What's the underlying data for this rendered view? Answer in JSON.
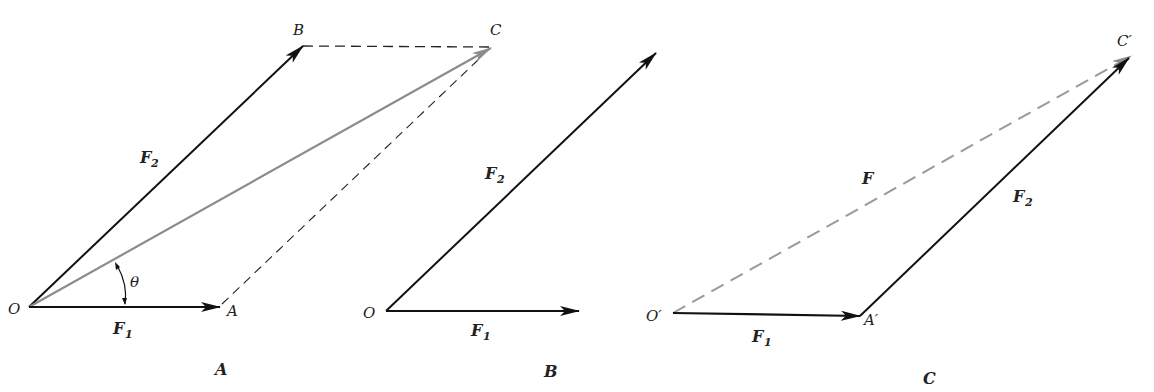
{
  "colors": {
    "vector": "#111111",
    "resultant": "#8c8c8c",
    "construction_dashed": "#222222",
    "resultant_dashed": "#9a9a9a",
    "background": "#ffffff"
  },
  "panels": [
    {
      "id": "A",
      "caption": "A",
      "method": "parallelogram",
      "points": {
        "O": "O",
        "A": "A",
        "B": "B",
        "C": "C"
      },
      "vectors": [
        {
          "name": "F1",
          "label": "F",
          "sub": "1",
          "from": "O",
          "to": "A",
          "style": "solid-black"
        },
        {
          "name": "F2",
          "label": "F",
          "sub": "2",
          "from": "O",
          "to": "B",
          "style": "solid-black"
        },
        {
          "name": "resultant",
          "from": "O",
          "to": "C",
          "style": "solid-gray"
        }
      ],
      "construction_lines": [
        {
          "from": "B",
          "to": "C",
          "style": "dashed"
        },
        {
          "from": "A",
          "to": "C",
          "style": "dashed"
        }
      ],
      "angle": {
        "label": "θ",
        "between": [
          "F1",
          "resultant"
        ]
      }
    },
    {
      "id": "B",
      "caption": "B",
      "method": "two vectors from common origin",
      "points": {
        "O": "O"
      },
      "vectors": [
        {
          "name": "F1",
          "label": "F",
          "sub": "1",
          "from": "O",
          "style": "solid-black"
        },
        {
          "name": "F2",
          "label": "F",
          "sub": "2",
          "from": "O",
          "style": "solid-black"
        }
      ]
    },
    {
      "id": "C",
      "caption": "C",
      "method": "triangle (head-to-tail)",
      "points": {
        "O": "O′",
        "A": "A′",
        "C": "C′"
      },
      "vectors": [
        {
          "name": "F1",
          "label": "F",
          "sub": "1",
          "from": "O′",
          "to": "A′",
          "style": "solid-black"
        },
        {
          "name": "F2",
          "label": "F",
          "sub": "2",
          "from": "A′",
          "to": "C′",
          "style": "solid-black"
        },
        {
          "name": "F",
          "label": "F",
          "from": "O′",
          "to": "C′",
          "style": "dashed-gray"
        }
      ]
    }
  ]
}
